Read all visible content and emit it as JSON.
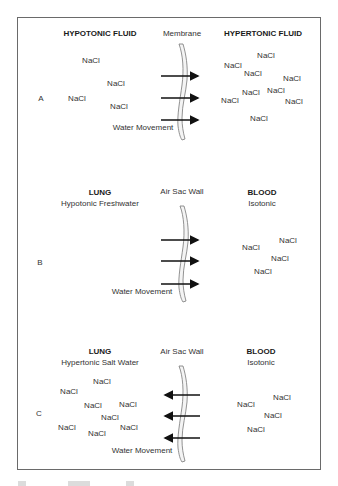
{
  "figure": {
    "panels": [
      {
        "id": "A",
        "label": "A",
        "left_title": "HYPOTONIC FLUID",
        "left_subtitle": "",
        "barrier_label": "Membrane",
        "right_title": "HYPERTONIC FLUID",
        "right_subtitle": "",
        "flow_label": "Water Movement",
        "arrow_direction": "right",
        "left_solute_count": 4,
        "right_solute_count": 9
      },
      {
        "id": "B",
        "label": "B",
        "left_title": "LUNG",
        "left_subtitle": "Hypotonic Freshwater",
        "barrier_label": "Air Sac Wall",
        "right_title": "BLOOD",
        "right_subtitle": "Isotonic",
        "flow_label": "Water Movement",
        "arrow_direction": "right",
        "left_solute_count": 0,
        "right_solute_count": 4
      },
      {
        "id": "C",
        "label": "C",
        "left_title": "LUNG",
        "left_subtitle": "Hypertonic Salt Water",
        "barrier_label": "Air Sac Wall",
        "right_title": "BLOOD",
        "right_subtitle": "Isotonic",
        "flow_label": "Water Movement",
        "arrow_direction": "left",
        "left_solute_count": 8,
        "right_solute_count": 4
      }
    ],
    "solute_label": "NaCl",
    "colors": {
      "text": "#333333",
      "arrow": "#111111",
      "frame": "#6a6a6a",
      "membrane": "#777777"
    }
  }
}
